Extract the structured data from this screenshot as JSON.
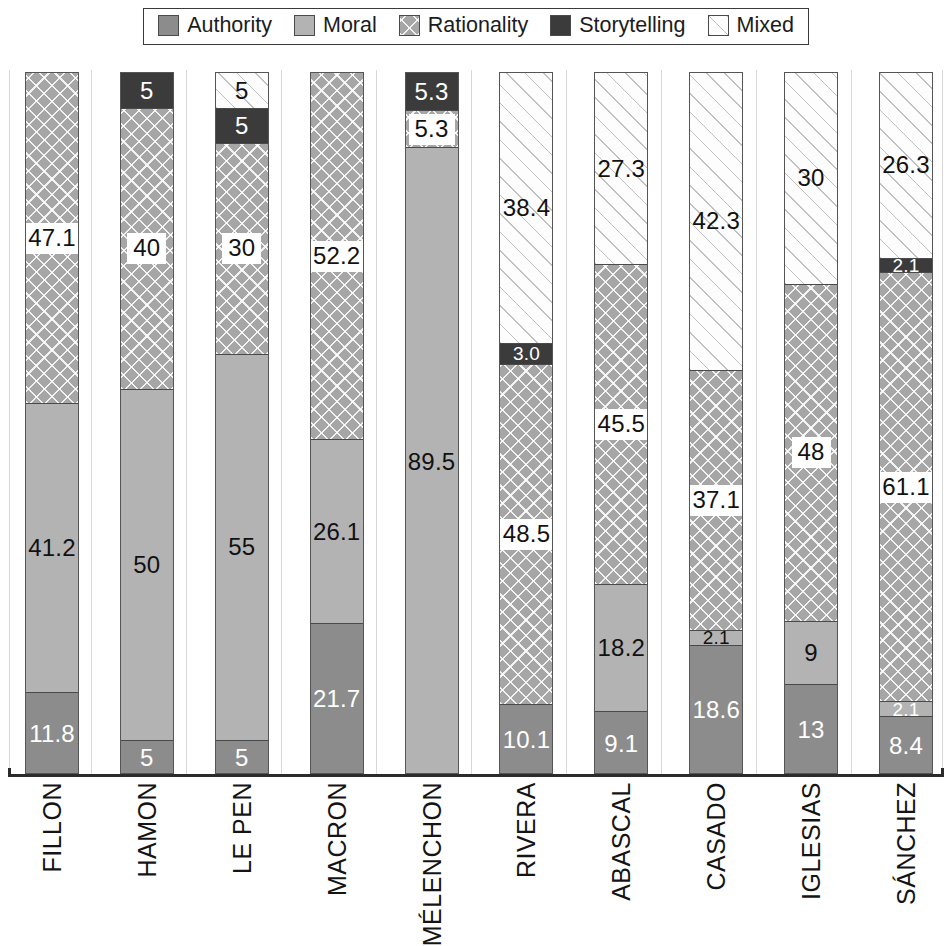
{
  "legend": {
    "position": "top-center",
    "items": [
      {
        "label": "Authority",
        "key": "authority",
        "swatch": "authority-swatch",
        "color": "#8c8c8c"
      },
      {
        "label": "Moral",
        "key": "moral",
        "swatch": "moral-swatch",
        "color": "#b3b3b3"
      },
      {
        "label": "Rationality",
        "key": "rationality",
        "swatch": "rationality-swatch",
        "color": "#a6a6a6"
      },
      {
        "label": "Storytelling",
        "key": "storytelling",
        "swatch": "storytelling-swatch",
        "color": "#3b3b3b"
      },
      {
        "label": "Mixed",
        "key": "mixed",
        "swatch": "mixed-swatch",
        "color": "#fdfdfd"
      }
    ]
  },
  "chart_data": {
    "type": "bar",
    "subtype": "stacked-100-percent",
    "orientation": "vertical",
    "title": "",
    "subtitle": "",
    "xlabel": "",
    "ylabel": "",
    "ylim": [
      0,
      100
    ],
    "grid": "vertical-separators-only",
    "legend_position": "top-center",
    "categories": [
      "FILLON",
      "HAMON",
      "LE PEN",
      "MACRON",
      "MÉLENCHON",
      "RIVERA",
      "ABASCAL",
      "CASADO",
      "IGLESIAS",
      "SÁNCHEZ"
    ],
    "series": [
      {
        "name": "Authority",
        "values": [
          11.8,
          5,
          5,
          21.7,
          0,
          10.1,
          9.1,
          18.6,
          13,
          8.4
        ]
      },
      {
        "name": "Moral",
        "values": [
          41.2,
          50,
          55,
          26.1,
          89.5,
          0,
          18.2,
          2.1,
          9,
          2.1
        ]
      },
      {
        "name": "Rationality",
        "values": [
          47.1,
          40,
          30,
          52.2,
          5.3,
          48.5,
          45.5,
          37.1,
          48,
          61.1
        ]
      },
      {
        "name": "Storytelling",
        "values": [
          0,
          5,
          5,
          0,
          5.3,
          3.0,
          0,
          0,
          0,
          2.1
        ]
      },
      {
        "name": "Mixed",
        "values": [
          0,
          0,
          5,
          0,
          0,
          38.4,
          27.3,
          42.3,
          30,
          26.3
        ]
      }
    ],
    "bars": [
      {
        "category": "FILLON",
        "segments": [
          {
            "series": "Rationality",
            "value": 47.1,
            "label": "47.1",
            "label_style": "boxed"
          },
          {
            "series": "Moral",
            "value": 41.2,
            "label": "41.2",
            "label_style": "plain-dark"
          },
          {
            "series": "Authority",
            "value": 11.8,
            "label": "11.8",
            "label_style": "plain-white"
          }
        ]
      },
      {
        "category": "HAMON",
        "segments": [
          {
            "series": "Storytelling",
            "value": 5,
            "label": "5",
            "label_style": "on-dark"
          },
          {
            "series": "Rationality",
            "value": 40,
            "label": "40",
            "label_style": "boxed"
          },
          {
            "series": "Moral",
            "value": 50,
            "label": "50",
            "label_style": "plain-dark"
          },
          {
            "series": "Authority",
            "value": 5,
            "label": "5",
            "label_style": "plain-white"
          }
        ]
      },
      {
        "category": "LE PEN",
        "segments": [
          {
            "series": "Mixed",
            "value": 5,
            "label": "5",
            "label_style": "plain-dark"
          },
          {
            "series": "Storytelling",
            "value": 5,
            "label": "5",
            "label_style": "on-dark"
          },
          {
            "series": "Rationality",
            "value": 30,
            "label": "30",
            "label_style": "boxed"
          },
          {
            "series": "Moral",
            "value": 55,
            "label": "55",
            "label_style": "plain-dark"
          },
          {
            "series": "Authority",
            "value": 5,
            "label": "5",
            "label_style": "plain-white"
          }
        ]
      },
      {
        "category": "MACRON",
        "segments": [
          {
            "series": "Rationality",
            "value": 52.2,
            "label": "52.2",
            "label_style": "boxed"
          },
          {
            "series": "Moral",
            "value": 26.1,
            "label": "26.1",
            "label_style": "plain-dark"
          },
          {
            "series": "Authority",
            "value": 21.7,
            "label": "21.7",
            "label_style": "plain-white"
          }
        ]
      },
      {
        "category": "MÉLENCHON",
        "segments": [
          {
            "series": "Storytelling",
            "value": 5.3,
            "label": "5.3",
            "label_style": "on-dark"
          },
          {
            "series": "Rationality",
            "value": 5.3,
            "label": "5.3",
            "label_style": "boxed"
          },
          {
            "series": "Moral",
            "value": 89.5,
            "label": "89.5",
            "label_style": "plain-dark"
          }
        ]
      },
      {
        "category": "RIVERA",
        "segments": [
          {
            "series": "Mixed",
            "value": 38.4,
            "label": "38.4",
            "label_style": "plain-dark"
          },
          {
            "series": "Storytelling",
            "value": 3.0,
            "label": "3.0",
            "label_style": "on-dark"
          },
          {
            "series": "Rationality",
            "value": 48.5,
            "label": "48.5",
            "label_style": "boxed"
          },
          {
            "series": "Authority",
            "value": 10.1,
            "label": "10.1",
            "label_style": "plain-white"
          }
        ]
      },
      {
        "category": "ABASCAL",
        "segments": [
          {
            "series": "Mixed",
            "value": 27.3,
            "label": "27.3",
            "label_style": "plain-dark"
          },
          {
            "series": "Rationality",
            "value": 45.5,
            "label": "45.5",
            "label_style": "boxed"
          },
          {
            "series": "Moral",
            "value": 18.2,
            "label": "18.2",
            "label_style": "plain-dark"
          },
          {
            "series": "Authority",
            "value": 9.1,
            "label": "9.1",
            "label_style": "plain-white"
          }
        ]
      },
      {
        "category": "CASADO",
        "segments": [
          {
            "series": "Mixed",
            "value": 42.3,
            "label": "42.3",
            "label_style": "plain-dark"
          },
          {
            "series": "Rationality",
            "value": 37.1,
            "label": "37.1",
            "label_style": "boxed"
          },
          {
            "series": "Moral",
            "value": 2.1,
            "label": "2.1",
            "label_style": "plain-dark"
          },
          {
            "series": "Authority",
            "value": 18.6,
            "label": "18.6",
            "label_style": "plain-white"
          }
        ]
      },
      {
        "category": "IGLESIAS",
        "segments": [
          {
            "series": "Mixed",
            "value": 30,
            "label": "30",
            "label_style": "plain-dark"
          },
          {
            "series": "Rationality",
            "value": 48,
            "label": "48",
            "label_style": "boxed"
          },
          {
            "series": "Moral",
            "value": 9,
            "label": "9",
            "label_style": "plain-dark"
          },
          {
            "series": "Authority",
            "value": 13,
            "label": "13",
            "label_style": "plain-white"
          }
        ]
      },
      {
        "category": "SÁNCHEZ",
        "segments": [
          {
            "series": "Mixed",
            "value": 26.3,
            "label": "26.3",
            "label_style": "plain-dark"
          },
          {
            "series": "Storytelling",
            "value": 2.1,
            "label": "2.1",
            "label_style": "on-dark"
          },
          {
            "series": "Rationality",
            "value": 61.1,
            "label": "61.1",
            "label_style": "boxed"
          },
          {
            "series": "Moral",
            "value": 2.1,
            "label": "2.1",
            "label_style": "plain-white"
          },
          {
            "series": "Authority",
            "value": 8.4,
            "label": "8.4",
            "label_style": "plain-white"
          }
        ]
      }
    ]
  }
}
